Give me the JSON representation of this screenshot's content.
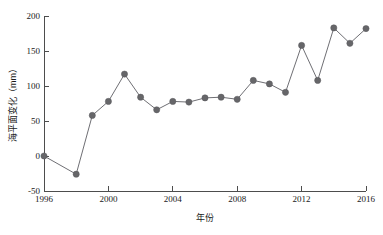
{
  "chart_data": {
    "type": "line",
    "title": "",
    "xlabel": "年份",
    "ylabel": "海平面变化（mm）",
    "xlim": [
      1996,
      2016
    ],
    "ylim": [
      -50,
      200
    ],
    "xticks": [
      1996,
      2000,
      2004,
      2008,
      2012,
      2016
    ],
    "yticks": [
      -50,
      0,
      50,
      100,
      150,
      200
    ],
    "grid": false,
    "legend": null,
    "marker": "circle",
    "series": [
      {
        "name": "海平面变化",
        "color": "#666669",
        "x": [
          1996,
          1998,
          1999,
          2000,
          2001,
          2002,
          2003,
          2004,
          2005,
          2006,
          2007,
          2008,
          2009,
          2010,
          2011,
          2012,
          2013,
          2014,
          2015,
          2016
        ],
        "values": [
          0,
          -26,
          58,
          78,
          117,
          84,
          66,
          78,
          77,
          83,
          84,
          81,
          108,
          103,
          91,
          158,
          108,
          183,
          161,
          182
        ]
      }
    ]
  },
  "axis": {
    "y_tick_labels": [
      "200",
      "150",
      "100",
      "50",
      "0",
      "-50"
    ],
    "x_tick_labels": [
      "1996",
      "2000",
      "2004",
      "2008",
      "2012",
      "2016"
    ],
    "y_title": "海平面变化（mm）",
    "x_title": "年份"
  }
}
